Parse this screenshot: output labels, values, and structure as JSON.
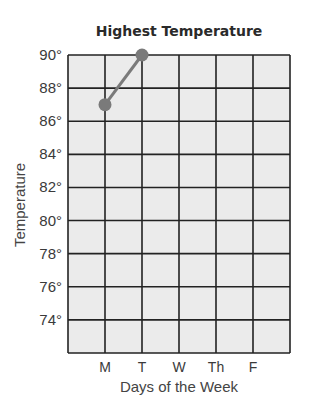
{
  "chart_data": {
    "type": "line",
    "title": "Highest Temperature",
    "xlabel": "Days of the Week",
    "ylabel": "Temperature",
    "categories": [
      "M",
      "T",
      "W",
      "Th",
      "F"
    ],
    "series": [
      {
        "name": "Highest Temperature",
        "values": [
          87,
          90,
          null,
          null,
          null
        ]
      }
    ],
    "yticks": [
      74,
      76,
      78,
      80,
      82,
      84,
      86,
      88,
      90
    ],
    "ytick_suffix": "°",
    "ylim": [
      72,
      90
    ],
    "grid": true,
    "legend": "none"
  },
  "colors": {
    "grid_fill": "#ebebeb",
    "grid_line": "#222222",
    "series": "#7a7a7a"
  }
}
